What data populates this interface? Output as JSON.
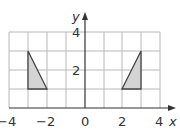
{
  "diagram": {
    "type": "coordinate-grid",
    "x_axis": {
      "label": "x",
      "min": -4,
      "max": 4,
      "tick_labels": [
        "−4",
        "−2",
        "0",
        "2",
        "4"
      ],
      "tick_values": [
        -4,
        -2,
        0,
        2,
        4
      ]
    },
    "y_axis": {
      "label": "y",
      "min": 0,
      "max": 4,
      "tick_labels": [
        "2",
        "4"
      ],
      "tick_values": [
        2,
        4
      ]
    },
    "grid": {
      "x_lines": [
        -4,
        -3,
        -2,
        -1,
        0,
        1,
        2,
        3,
        4
      ],
      "y_lines": [
        1,
        2,
        3,
        4
      ]
    },
    "shapes": [
      {
        "name": "left-triangle",
        "vertices": [
          [
            -3,
            3
          ],
          [
            -3,
            1
          ],
          [
            -2,
            1
          ]
        ],
        "fill": "#d4d4d4",
        "stroke": "#444444"
      },
      {
        "name": "right-triangle",
        "vertices": [
          [
            3,
            3
          ],
          [
            3,
            1
          ],
          [
            2,
            1
          ]
        ],
        "fill": "#d4d4d4",
        "stroke": "#444444"
      }
    ],
    "colors": {
      "grid": "#b8b8b8",
      "axis": "#333333",
      "shape_fill": "#d4d4d4",
      "shape_stroke": "#444444"
    }
  }
}
